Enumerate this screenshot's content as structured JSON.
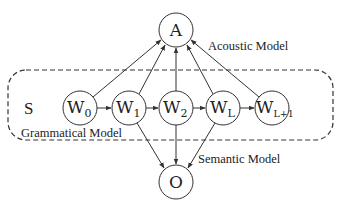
{
  "diagram": {
    "type": "graphical-model",
    "group": {
      "name": "Grammatical Model",
      "label": "Grammatical Model",
      "symbol": "S"
    },
    "nodes": {
      "A": {
        "main": "A",
        "sub": ""
      },
      "W0": {
        "main": "W",
        "sub": "0"
      },
      "W1": {
        "main": "W",
        "sub": "1"
      },
      "W2": {
        "main": "W",
        "sub": "2"
      },
      "WL": {
        "main": "W",
        "sub": "L"
      },
      "WL1": {
        "main": "W",
        "sub": "L+1"
      },
      "O": {
        "main": "O",
        "sub": ""
      }
    },
    "labels": {
      "acoustic": "Acoustic Model",
      "semantic": "Semantic Model",
      "grammatical": "Grammatical Model",
      "s": "S"
    },
    "edges": [
      [
        "W0",
        "A"
      ],
      [
        "W1",
        "A"
      ],
      [
        "W2",
        "A"
      ],
      [
        "WL",
        "A"
      ],
      [
        "WL1",
        "A"
      ],
      [
        "W0",
        "W1"
      ],
      [
        "W1",
        "W2"
      ],
      [
        "W2",
        "WL"
      ],
      [
        "WL",
        "WL1"
      ],
      [
        "W1",
        "O"
      ],
      [
        "W2",
        "O"
      ],
      [
        "WL",
        "O"
      ]
    ]
  }
}
